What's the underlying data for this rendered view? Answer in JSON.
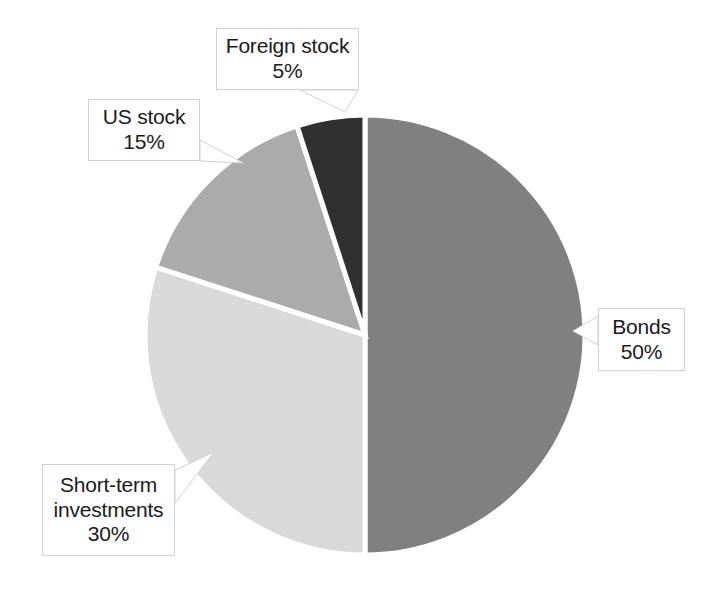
{
  "chart_data": {
    "type": "pie",
    "title": "",
    "subtitle": "",
    "xlabel": "",
    "ylabel": "",
    "legend_position": "none",
    "grid": false,
    "unit": "%",
    "start_angle_deg": 0,
    "direction": "clockwise",
    "categories": [
      "Bonds",
      "Short-term investments",
      "US stock",
      "Foreign stock"
    ],
    "values": [
      50,
      30,
      15,
      5
    ],
    "slices": [
      {
        "label": "Bonds",
        "value": 50,
        "value_text": "50%",
        "color": "#808080",
        "start_deg": 0,
        "end_deg": 180
      },
      {
        "label": "Short-term investments",
        "value": 30,
        "value_text": "30%",
        "color": "#d9d9d9",
        "start_deg": 180,
        "end_deg": 288
      },
      {
        "label": "US stock",
        "value": 15,
        "value_text": "15%",
        "color": "#ababab",
        "start_deg": 288,
        "end_deg": 342
      },
      {
        "label": "Foreign stock",
        "value": 5,
        "value_text": "5%",
        "color": "#303030",
        "start_deg": 342,
        "end_deg": 360
      }
    ]
  },
  "callouts": {
    "foreign_stock": {
      "label": "Foreign stock",
      "value_text": "5%"
    },
    "us_stock": {
      "label": "US stock",
      "value_text": "15%"
    },
    "short_term": {
      "label_line1": "Short-term",
      "label_line2": "investments",
      "value_text": "30%"
    },
    "bonds": {
      "label": "Bonds",
      "value_text": "50%"
    }
  },
  "style": {
    "background": "#ffffff",
    "slice_separator": "#ffffff",
    "callout_border": "#d2d2d2",
    "text_color": "#1a1a1a"
  }
}
